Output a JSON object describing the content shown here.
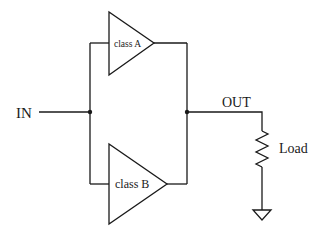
{
  "diagram": {
    "type": "circuit-schematic",
    "labels": {
      "input": "IN",
      "output": "OUT",
      "load": "Load",
      "amp_a": "class A",
      "amp_b": "class B"
    },
    "components": [
      {
        "id": "amp-a",
        "kind": "amplifier",
        "label": "class A"
      },
      {
        "id": "amp-b",
        "kind": "amplifier",
        "label": "class B"
      },
      {
        "id": "load",
        "kind": "resistor",
        "label": "Load"
      },
      {
        "id": "gnd",
        "kind": "ground"
      }
    ],
    "connections": [
      {
        "from": "IN",
        "to": "input-junction"
      },
      {
        "from": "input-junction",
        "to": "amp-a.in"
      },
      {
        "from": "input-junction",
        "to": "amp-b.in"
      },
      {
        "from": "amp-a.out",
        "to": "output-junction"
      },
      {
        "from": "amp-b.out",
        "to": "output-junction"
      },
      {
        "from": "output-junction",
        "to": "OUT"
      },
      {
        "from": "OUT",
        "to": "load"
      },
      {
        "from": "load",
        "to": "gnd"
      }
    ],
    "colors": {
      "stroke": "#1a1a1a",
      "background": "#ffffff"
    }
  }
}
